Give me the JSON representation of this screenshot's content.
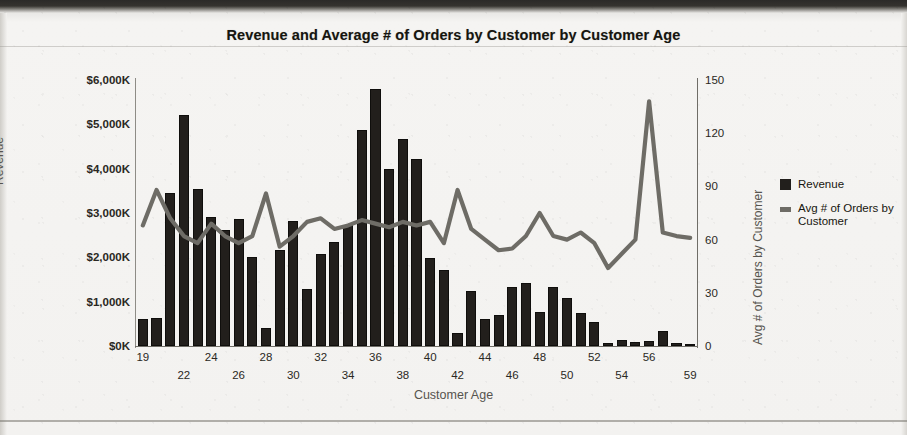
{
  "chart_data": {
    "type": "bar",
    "title": "Revenue and Average # of Orders by Customer by Customer Age",
    "xlabel": "Customer Age",
    "ylabel": "Revenue",
    "y2label": "Avg # of Orders by Customer",
    "grid": false,
    "legend_position": "right",
    "ylim": [
      0,
      6000
    ],
    "y2lim": [
      0,
      150
    ],
    "ytick_labels": [
      "$6,000K",
      "$5,000K",
      "$4,000K",
      "$3,000K",
      "$2,000K",
      "$1,000K",
      "$0K"
    ],
    "ytick_values": [
      6000,
      5000,
      4000,
      3000,
      2000,
      1000,
      0
    ],
    "y2tick_labels": [
      "150",
      "120",
      "90",
      "60",
      "30",
      "0"
    ],
    "y2tick_values": [
      150,
      120,
      90,
      60,
      30,
      0
    ],
    "categories": [
      19,
      20,
      21,
      22,
      23,
      24,
      25,
      26,
      27,
      28,
      29,
      30,
      31,
      32,
      33,
      34,
      35,
      36,
      37,
      38,
      39,
      40,
      41,
      42,
      43,
      44,
      45,
      46,
      47,
      48,
      49,
      50,
      51,
      52,
      53,
      54,
      55,
      56,
      57,
      58,
      59
    ],
    "xtick_labels": [
      "19",
      "22",
      "24",
      "26",
      "28",
      "30",
      "32",
      "34",
      "36",
      "38",
      "40",
      "42",
      "44",
      "46",
      "48",
      "50",
      "52",
      "54",
      "56",
      "59"
    ],
    "series": [
      {
        "name": "Revenue",
        "type": "bar",
        "axis": "left",
        "color": "#221f1c",
        "unit": "$K",
        "values": [
          620,
          640,
          3450,
          5200,
          3550,
          2900,
          2620,
          2870,
          2010,
          400,
          2160,
          2830,
          1280,
          2080,
          2350,
          2740,
          4880,
          5790,
          3990,
          4680,
          4220,
          1990,
          1720,
          300,
          1240,
          620,
          700,
          1330,
          1430,
          760,
          1320,
          1080,
          740,
          540,
          60,
          130,
          100,
          120,
          330,
          75,
          55
        ]
      },
      {
        "name": "Avg # of Orders by Customer",
        "type": "line",
        "axis": "right",
        "color": "#6e6c66",
        "values": [
          68,
          88,
          72,
          62,
          58,
          69,
          62,
          58,
          62,
          86,
          56,
          62,
          70,
          72,
          66,
          68,
          71,
          69,
          67,
          70,
          68,
          70,
          58,
          88,
          66,
          60,
          54,
          55,
          62,
          75,
          62,
          60,
          64,
          58,
          44,
          52,
          60,
          138,
          64,
          62,
          61
        ]
      }
    ]
  },
  "legend": {
    "items": [
      {
        "label": "Revenue",
        "marker": "bar-swatch"
      },
      {
        "label": "Avg # of Orders by Customer",
        "marker": "line-swatch"
      }
    ]
  }
}
